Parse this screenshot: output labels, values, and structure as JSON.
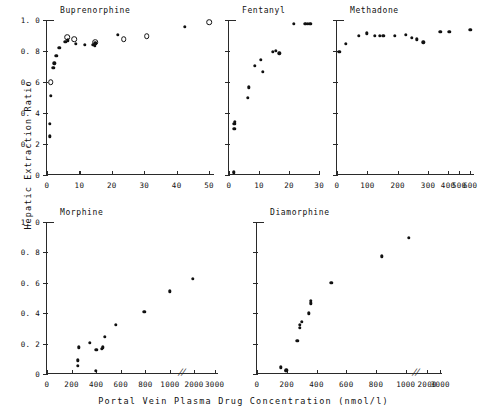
{
  "figure": {
    "ylabel": "Hepatic Extraction Ratio",
    "xlabel": "Portal Vein  Plasma Drug Concentration  (nmol/l)"
  },
  "chart_data": [
    {
      "type": "scatter",
      "title": "Buprenorphine",
      "xlabel": "",
      "ylabel": "Hepatic Extraction Ratio",
      "xlim": [
        0,
        52
      ],
      "ylim": [
        0,
        1.0
      ],
      "xticks": [
        0,
        10,
        20,
        30,
        40,
        50
      ],
      "xticklabels": [
        "0",
        "10",
        "20",
        "30",
        "40",
        "50"
      ],
      "yticks": [
        0,
        0.2,
        0.4,
        0.6,
        0.8,
        1.0
      ],
      "yticklabels": [
        "0",
        "0. 2",
        "0. 4",
        "0. 6",
        "0. 8",
        "1. 0"
      ],
      "grid": false,
      "legend": "none",
      "series": [
        {
          "name": "filled",
          "marker": "filled-circle",
          "points": [
            [
              0.8,
              0.25
            ],
            [
              0.9,
              0.33
            ],
            [
              1.2,
              0.51
            ],
            [
              2.0,
              0.69
            ],
            [
              2.3,
              0.72
            ],
            [
              2.9,
              0.77
            ],
            [
              3.8,
              0.82
            ],
            [
              5.6,
              0.86
            ],
            [
              6.4,
              0.87
            ],
            [
              8.8,
              0.845
            ],
            [
              11.6,
              0.84
            ],
            [
              14.1,
              0.84
            ],
            [
              14.8,
              0.835
            ],
            [
              14.9,
              0.85
            ],
            [
              21.8,
              0.905
            ],
            [
              42.5,
              0.955
            ]
          ]
        },
        {
          "name": "open",
          "marker": "open-circle",
          "points": [
            [
              1.1,
              0.6
            ],
            [
              6.2,
              0.89
            ],
            [
              8.4,
              0.875
            ],
            [
              14.9,
              0.855
            ],
            [
              23.6,
              0.875
            ],
            [
              30.8,
              0.895
            ],
            [
              50.0,
              0.985
            ]
          ]
        }
      ]
    },
    {
      "type": "scatter",
      "title": "Fentanyl",
      "xlabel": "",
      "ylabel": "Hepatic Extraction Ratio",
      "xlim": [
        0,
        30
      ],
      "ylim": [
        0,
        1.0
      ],
      "xticks": [
        0,
        10,
        20,
        30
      ],
      "xticklabels": [
        "0",
        "10",
        "20",
        "30"
      ],
      "yticks": [
        0,
        0.2,
        0.4,
        0.6,
        0.8,
        1.0
      ],
      "yticklabels": [
        "",
        "",
        "",
        "",
        "",
        ""
      ],
      "grid": false,
      "legend": "none",
      "series": [
        {
          "name": "filled",
          "marker": "filled-circle",
          "points": [
            [
              1.6,
              0.015
            ],
            [
              1.7,
              0.02
            ],
            [
              1.8,
              0.3
            ],
            [
              1.8,
              0.33
            ],
            [
              1.85,
              0.345
            ],
            [
              6.2,
              0.5
            ],
            [
              6.6,
              0.565
            ],
            [
              8.6,
              0.705
            ],
            [
              10.6,
              0.745
            ],
            [
              11.2,
              0.665
            ],
            [
              14.6,
              0.795
            ],
            [
              15.6,
              0.8
            ],
            [
              16.8,
              0.785
            ],
            [
              21.6,
              0.975
            ],
            [
              25.4,
              0.975
            ],
            [
              26.2,
              0.975
            ],
            [
              26.8,
              0.975
            ],
            [
              27.3,
              0.975
            ]
          ]
        }
      ]
    },
    {
      "type": "scatter",
      "title": "Methadone",
      "xlabel": "",
      "ylabel": "Hepatic Extraction Ratio",
      "xlim": [
        0,
        600
      ],
      "ylim": [
        0,
        1.0
      ],
      "xticks": [
        0,
        100,
        200,
        300,
        400,
        500,
        600
      ],
      "xticklabels": [
        "0",
        "100",
        "200",
        "300",
        "400",
        "500",
        "600"
      ],
      "yticks": [
        0,
        0.2,
        0.4,
        0.6,
        0.8,
        1.0
      ],
      "yticklabels": [
        "",
        "",
        "",
        "",
        "",
        ""
      ],
      "axis_note": "x-axis compressed between 300 and 600",
      "grid": false,
      "legend": "none",
      "series": [
        {
          "name": "filled",
          "marker": "filled-circle",
          "points": [
            [
              8,
              0.795
            ],
            [
              28,
              0.845
            ],
            [
              72,
              0.9
            ],
            [
              98,
              0.915
            ],
            [
              124,
              0.9
            ],
            [
              140,
              0.9
            ],
            [
              152,
              0.9
            ],
            [
              190,
              0.9
            ],
            [
              226,
              0.905
            ],
            [
              246,
              0.885
            ],
            [
              262,
              0.875
            ],
            [
              284,
              0.855
            ],
            [
              362,
              0.925
            ],
            [
              412,
              0.925
            ],
            [
              600,
              0.935
            ]
          ]
        }
      ]
    },
    {
      "type": "scatter",
      "title": "Morphine",
      "xlabel": "",
      "ylabel": "Hepatic Extraction Ratio",
      "xlim": [
        0,
        3000
      ],
      "ylim": [
        0,
        1.0
      ],
      "xticks": [
        0,
        200,
        400,
        600,
        800,
        1000,
        2000,
        3000
      ],
      "xticklabels": [
        "0",
        "200",
        "400",
        "600",
        "800",
        "1000",
        "2000",
        "3000"
      ],
      "yticks": [
        0,
        0.2,
        0.4,
        0.6,
        0.8,
        1.0
      ],
      "yticklabels": [
        "0",
        "0. 2",
        "0. 4",
        "0. 6",
        "0. 8",
        "1. 0"
      ],
      "axis_note": "axis break between 1000 and 2000",
      "grid": false,
      "legend": "none",
      "series": [
        {
          "name": "filled",
          "marker": "filled-circle",
          "points": [
            [
              252,
              0.055
            ],
            [
              252,
              0.09
            ],
            [
              258,
              0.175
            ],
            [
              350,
              0.205
            ],
            [
              396,
              0.02
            ],
            [
              400,
              0.16
            ],
            [
              448,
              0.165
            ],
            [
              452,
              0.175
            ],
            [
              470,
              0.245
            ],
            [
              560,
              0.325
            ],
            [
              790,
              0.41
            ],
            [
              1000,
              0.545
            ],
            [
              1950,
              0.625
            ]
          ]
        }
      ]
    },
    {
      "type": "scatter",
      "title": "Diamorphine",
      "xlabel": "",
      "ylabel": "Hepatic Extraction Ratio",
      "xlim": [
        0,
        3000
      ],
      "ylim": [
        0,
        1.0
      ],
      "xticks": [
        0,
        200,
        400,
        600,
        800,
        1000,
        2000,
        3000
      ],
      "xticklabels": [
        "0",
        "200",
        "400",
        "600",
        "800",
        "1000",
        "2000",
        "3000"
      ],
      "yticks": [
        0,
        0.2,
        0.4,
        0.6,
        0.8,
        1.0
      ],
      "yticklabels": [
        "",
        "",
        "",
        "",
        "",
        ""
      ],
      "axis_note": "axis break between 1000 and 2000",
      "grid": false,
      "legend": "none",
      "series": [
        {
          "name": "filled",
          "marker": "filled-circle",
          "points": [
            [
              162,
              0.045
            ],
            [
              192,
              0.02
            ],
            [
              196,
              0.025
            ],
            [
              272,
              0.22
            ],
            [
              288,
              0.305
            ],
            [
              288,
              0.325
            ],
            [
              300,
              0.345
            ],
            [
              350,
              0.4
            ],
            [
              360,
              0.465
            ],
            [
              362,
              0.48
            ],
            [
              500,
              0.6
            ],
            [
              840,
              0.775
            ],
            [
              1130,
              0.895
            ]
          ]
        }
      ]
    }
  ]
}
